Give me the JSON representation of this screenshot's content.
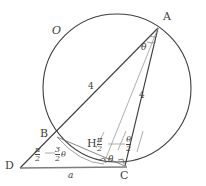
{
  "figure": {
    "type": "geometry-diagram",
    "stroke_color": "#3f3f3f",
    "background": "#ffffff",
    "points": {
      "A": {
        "label": "A",
        "x": 158,
        "y": 28,
        "label_x": 163,
        "label_y": 12
      },
      "B": {
        "label": "B",
        "x": 57,
        "y": 137,
        "label_x": 41,
        "label_y": 129
      },
      "C": {
        "label": "C",
        "x": 125,
        "y": 166,
        "label_x": 121,
        "label_y": 172
      },
      "D": {
        "label": "D",
        "x": 20,
        "y": 168,
        "label_x": 6,
        "label_y": 161
      },
      "H": {
        "label": "H",
        "x": 107,
        "y": 148,
        "label_x": 88,
        "label_y": 139
      },
      "O": {
        "label": "O",
        "x": 117,
        "y": 88,
        "label_x": 53,
        "label_y": 25
      }
    },
    "circle": {
      "cx": 117,
      "cy": 88,
      "r": 74
    },
    "segments": [
      {
        "name": "segment-D-A",
        "from": "D",
        "to": "A",
        "through": "B"
      },
      {
        "name": "segment-D-C",
        "from": "D",
        "to": "C"
      },
      {
        "name": "segment-B-C",
        "from": "B",
        "to": "C"
      },
      {
        "name": "segment-A-C",
        "from": "A",
        "to": "C"
      },
      {
        "name": "segment-A-H",
        "from": "A",
        "to": "H"
      },
      {
        "name": "segment-B-H",
        "from": "B",
        "to": "H"
      }
    ],
    "length_labels": [
      {
        "name": "length-BA",
        "text": "4",
        "x": 89,
        "y": 83
      },
      {
        "name": "length-AC",
        "text": "4",
        "x": 140,
        "y": 92
      },
      {
        "name": "length-DC",
        "text": "a",
        "x": 69,
        "y": 172
      }
    ],
    "angle_labels": [
      {
        "name": "angle-at-A-theta",
        "text": "θ",
        "x": 142,
        "y": 47
      },
      {
        "name": "angle-at-C-theta",
        "text": "θ",
        "x": 109,
        "y": 158
      }
    ],
    "fraction_labels": [
      {
        "name": "angle-at-D-pi-over-2",
        "num": "π",
        "den": "2",
        "tail": "",
        "x": 37,
        "y": 149
      },
      {
        "name": "angle-at-B-three-halves-theta",
        "num": "3",
        "den": "2",
        "tail": "θ",
        "x": 57,
        "y": 149
      },
      {
        "name": "angle-at-H-pi-over-2",
        "num": "π",
        "den": "2",
        "tail": "",
        "x": 98,
        "y": 139
      },
      {
        "name": "angle-at-A-theta-over-2",
        "num": "θ",
        "den": "2",
        "tail": "",
        "x": 127,
        "y": 139
      }
    ]
  }
}
